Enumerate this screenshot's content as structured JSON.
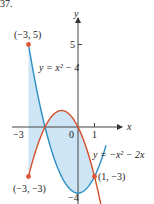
{
  "chart_data": {
    "type": "line",
    "title": "",
    "problem_number": "37.",
    "xlabel": "x",
    "ylabel": "y",
    "origin_px": [
      78,
      127
    ],
    "scale_px_per_unit": 16.5,
    "x_ticks": [
      {
        "value": -3,
        "label": "−3"
      },
      {
        "value": 0,
        "label": "0"
      },
      {
        "value": 1,
        "label": "1"
      }
    ],
    "y_ticks": [
      {
        "value": 5,
        "label": "5"
      },
      {
        "value": -4,
        "label": "−4"
      }
    ],
    "series": [
      {
        "name": "y = x² − 4",
        "formula": "x^2 - 4",
        "color": "#2b8fc4",
        "x_range": [
          -3,
          1.7
        ]
      },
      {
        "name": "y = −x² − 2x",
        "formula": "-x^2 - 2x",
        "color": "#d4502b",
        "x_range": [
          -3,
          1.9
        ]
      }
    ],
    "shaded_region": {
      "between": [
        "x^2 - 4",
        "-x^2 - 2x"
      ],
      "x_range": [
        -3,
        1
      ],
      "color": "#cde5f4"
    },
    "points": [
      {
        "x": -3,
        "y": 5,
        "label": "(−3, 5)"
      },
      {
        "x": -3,
        "y": -3,
        "label": "(−3, −3)"
      },
      {
        "x": 1,
        "y": -3,
        "label": "(1, −3)"
      }
    ],
    "point_color": "#e0553a",
    "annotations": {
      "curve1_label": "y = x² − 4",
      "curve2_label": "y = −x² − 2x"
    }
  }
}
